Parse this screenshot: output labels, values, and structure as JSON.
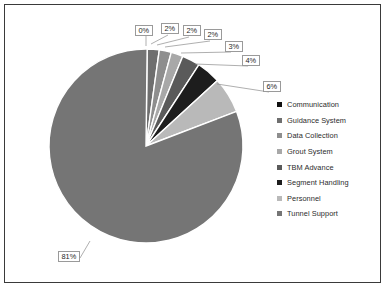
{
  "chart_data": {
    "type": "pie",
    "title": "",
    "legend_position": "right",
    "categories": [
      "Communication",
      "Guidance System",
      "Data Collection",
      "Grout System",
      "TBM Advance",
      "Segment Handling",
      "Personnel",
      "Tunnel Support"
    ],
    "values": [
      0,
      2,
      2,
      2,
      3,
      4,
      6,
      81
    ],
    "labels": [
      "0%",
      "2%",
      "2%",
      "2%",
      "3%",
      "4%",
      "6%",
      "81%"
    ],
    "unit": "%",
    "colors": [
      "#111111",
      "#6f6f6f",
      "#8e8e8e",
      "#a8a8a8",
      "#5a5a5a",
      "#1d1d1d",
      "#b9b9b9",
      "#757575"
    ],
    "slice_separator_color": "#ffffff",
    "start_angle_deg": -90,
    "frame_color": "#3a3a3a",
    "background": "#ffffff"
  },
  "legend": {
    "items": [
      {
        "label": "Communication",
        "color": "#111111"
      },
      {
        "label": "Guidance System",
        "color": "#6f6f6f"
      },
      {
        "label": "Data Collection",
        "color": "#8e8e8e"
      },
      {
        "label": "Grout System",
        "color": "#a8a8a8"
      },
      {
        "label": "TBM Advance",
        "color": "#5a5a5a"
      },
      {
        "label": "Segment Handling",
        "color": "#1d1d1d"
      },
      {
        "label": "Personnel",
        "color": "#b9b9b9"
      },
      {
        "label": "Tunnel Support",
        "color": "#757575"
      }
    ]
  },
  "callouts": [
    {
      "text": "0%",
      "left": 130,
      "top": 20
    },
    {
      "text": "2%",
      "left": 156,
      "top": 18
    },
    {
      "text": "2%",
      "left": 178,
      "top": 20
    },
    {
      "text": "2%",
      "left": 199,
      "top": 24
    },
    {
      "text": "3%",
      "left": 220,
      "top": 36
    },
    {
      "text": "4%",
      "left": 237,
      "top": 50
    },
    {
      "text": "6%",
      "left": 258,
      "top": 76
    },
    {
      "text": "81%",
      "left": 53,
      "top": 246
    }
  ]
}
